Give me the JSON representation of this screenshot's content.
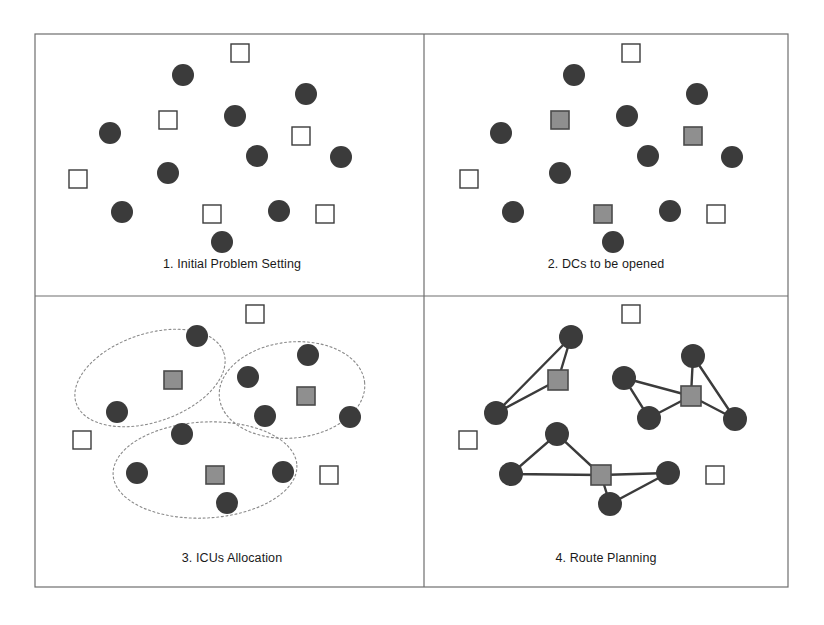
{
  "figure": {
    "background_color": "#ffffff",
    "frame": {
      "x": 35,
      "y": 34,
      "width": 753,
      "height": 553,
      "mid_x": 424,
      "mid_y": 296,
      "stroke_color": "#6e6e6e"
    },
    "colors": {
      "customer_circle": "#3b3b3b",
      "candidate_square_fill": "#ffffff",
      "candidate_square_stroke": "#3b3b3b",
      "opened_dc_fill": "#8f8f8f",
      "opened_dc_stroke": "#4a4a4a",
      "cluster_outline": "#8a8a8a",
      "route_line": "#3b3b3b",
      "label_text": "#1a1a1a"
    },
    "legend_semantics": {
      "circle": "customer / ICU node",
      "open_square": "candidate DC location",
      "filled_square": "opened DC"
    }
  },
  "panels": [
    {
      "id": "panel-1",
      "label": "1. Initial Problem Setting",
      "label_x": 232,
      "label_y": 268,
      "circles": [
        {
          "cx": 183,
          "cy": 75,
          "r": 11
        },
        {
          "cx": 306,
          "cy": 94,
          "r": 11
        },
        {
          "cx": 235,
          "cy": 116,
          "r": 11
        },
        {
          "cx": 110,
          "cy": 133,
          "r": 11
        },
        {
          "cx": 257,
          "cy": 156,
          "r": 11
        },
        {
          "cx": 341,
          "cy": 157,
          "r": 11
        },
        {
          "cx": 168,
          "cy": 173,
          "r": 11
        },
        {
          "cx": 122,
          "cy": 212,
          "r": 11
        },
        {
          "cx": 279,
          "cy": 211,
          "r": 11
        },
        {
          "cx": 222,
          "cy": 242,
          "r": 11
        }
      ],
      "squares": [
        {
          "x": 231,
          "y": 44,
          "size": 18,
          "state": "open"
        },
        {
          "x": 159,
          "y": 111,
          "size": 18,
          "state": "open"
        },
        {
          "x": 292,
          "y": 127,
          "size": 18,
          "state": "open"
        },
        {
          "x": 69,
          "y": 170,
          "size": 18,
          "state": "open"
        },
        {
          "x": 203,
          "y": 205,
          "size": 18,
          "state": "open"
        },
        {
          "x": 316,
          "y": 205,
          "size": 18,
          "state": "open"
        }
      ]
    },
    {
      "id": "panel-2",
      "label": "2. DCs to be opened",
      "label_x": 606,
      "label_y": 268,
      "circles": [
        {
          "cx": 574,
          "cy": 75,
          "r": 11
        },
        {
          "cx": 697,
          "cy": 94,
          "r": 11
        },
        {
          "cx": 627,
          "cy": 116,
          "r": 11
        },
        {
          "cx": 501,
          "cy": 133,
          "r": 11
        },
        {
          "cx": 648,
          "cy": 156,
          "r": 11
        },
        {
          "cx": 732,
          "cy": 157,
          "r": 11
        },
        {
          "cx": 560,
          "cy": 173,
          "r": 11
        },
        {
          "cx": 513,
          "cy": 212,
          "r": 11
        },
        {
          "cx": 670,
          "cy": 211,
          "r": 11
        },
        {
          "cx": 613,
          "cy": 242,
          "r": 11
        }
      ],
      "squares": [
        {
          "x": 622,
          "y": 44,
          "size": 18,
          "state": "open"
        },
        {
          "x": 551,
          "y": 111,
          "size": 18,
          "state": "filled"
        },
        {
          "x": 684,
          "y": 127,
          "size": 18,
          "state": "filled"
        },
        {
          "x": 460,
          "y": 170,
          "size": 18,
          "state": "open"
        },
        {
          "x": 594,
          "y": 205,
          "size": 18,
          "state": "filled"
        },
        {
          "x": 707,
          "y": 205,
          "size": 18,
          "state": "open"
        }
      ]
    },
    {
      "id": "panel-3",
      "label": "3. ICUs Allocation",
      "label_x": 232,
      "label_y": 562,
      "circles": [
        {
          "cx": 197,
          "cy": 336,
          "r": 11
        },
        {
          "cx": 308,
          "cy": 355,
          "r": 11
        },
        {
          "cx": 248,
          "cy": 377,
          "r": 11
        },
        {
          "cx": 117,
          "cy": 412,
          "r": 11
        },
        {
          "cx": 265,
          "cy": 416,
          "r": 11
        },
        {
          "cx": 350,
          "cy": 417,
          "r": 11
        },
        {
          "cx": 182,
          "cy": 434,
          "r": 11
        },
        {
          "cx": 137,
          "cy": 473,
          "r": 11
        },
        {
          "cx": 283,
          "cy": 472,
          "r": 11
        },
        {
          "cx": 227,
          "cy": 503,
          "r": 11
        }
      ],
      "squares": [
        {
          "x": 246,
          "y": 305,
          "size": 18,
          "state": "open"
        },
        {
          "x": 164,
          "y": 371,
          "size": 18,
          "state": "filled"
        },
        {
          "x": 297,
          "y": 387,
          "size": 18,
          "state": "filled"
        },
        {
          "x": 73,
          "y": 431,
          "size": 18,
          "state": "open"
        },
        {
          "x": 206,
          "y": 466,
          "size": 18,
          "state": "filled"
        },
        {
          "x": 320,
          "y": 466,
          "size": 18,
          "state": "open"
        }
      ],
      "clusters": [
        {
          "cx": 150,
          "cy": 378,
          "rx": 78,
          "ry": 44,
          "rotate": -19,
          "members": [
            "circle-1",
            "circle-4",
            "square-dc-1"
          ]
        },
        {
          "cx": 292,
          "cy": 390,
          "rx": 73,
          "ry": 48,
          "rotate": -6,
          "members": [
            "circle-2",
            "circle-3",
            "circle-5",
            "circle-6",
            "square-dc-2"
          ]
        },
        {
          "cx": 205,
          "cy": 470,
          "rx": 92,
          "ry": 48,
          "rotate": -3,
          "members": [
            "circle-7",
            "circle-8",
            "circle-9",
            "circle-10",
            "square-dc-3"
          ]
        }
      ]
    },
    {
      "id": "panel-4",
      "label": "4. Route Planning",
      "label_x": 606,
      "label_y": 562,
      "circles": [
        {
          "cx": 571,
          "cy": 337,
          "r": 12
        },
        {
          "cx": 693,
          "cy": 356,
          "r": 12
        },
        {
          "cx": 624,
          "cy": 378,
          "r": 12
        },
        {
          "cx": 496,
          "cy": 413,
          "r": 12
        },
        {
          "cx": 649,
          "cy": 418,
          "r": 12
        },
        {
          "cx": 735,
          "cy": 419,
          "r": 12
        },
        {
          "cx": 557,
          "cy": 434,
          "r": 12
        },
        {
          "cx": 511,
          "cy": 474,
          "r": 12
        },
        {
          "cx": 668,
          "cy": 473,
          "r": 12
        },
        {
          "cx": 610,
          "cy": 504,
          "r": 12
        }
      ],
      "squares": [
        {
          "x": 622,
          "y": 305,
          "size": 18,
          "state": "open"
        },
        {
          "x": 548,
          "y": 370,
          "size": 20,
          "state": "filled"
        },
        {
          "x": 681,
          "y": 386,
          "size": 20,
          "state": "filled"
        },
        {
          "x": 459,
          "y": 431,
          "size": 18,
          "state": "open"
        },
        {
          "x": 591,
          "y": 465,
          "size": 20,
          "state": "filled"
        },
        {
          "x": 706,
          "y": 466,
          "size": 18,
          "state": "open"
        }
      ],
      "routes": [
        {
          "name": "route-dc-1-loop-1",
          "points": [
            [
              558,
              380
            ],
            [
              571,
              337
            ],
            [
              496,
              413
            ],
            [
              558,
              380
            ]
          ]
        },
        {
          "name": "route-dc-2-loop-left",
          "points": [
            [
              691,
              396
            ],
            [
              624,
              378
            ],
            [
              649,
              418
            ],
            [
              691,
              396
            ]
          ]
        },
        {
          "name": "route-dc-2-loop-right",
          "points": [
            [
              691,
              396
            ],
            [
              693,
              356
            ],
            [
              735,
              419
            ],
            [
              691,
              396
            ]
          ]
        },
        {
          "name": "route-dc-3-loop-left",
          "points": [
            [
              601,
              475
            ],
            [
              557,
              434
            ],
            [
              511,
              474
            ],
            [
              601,
              475
            ]
          ]
        },
        {
          "name": "route-dc-3-loop-right",
          "points": [
            [
              601,
              475
            ],
            [
              668,
              473
            ],
            [
              610,
              504
            ],
            [
              601,
              475
            ]
          ]
        }
      ]
    }
  ]
}
